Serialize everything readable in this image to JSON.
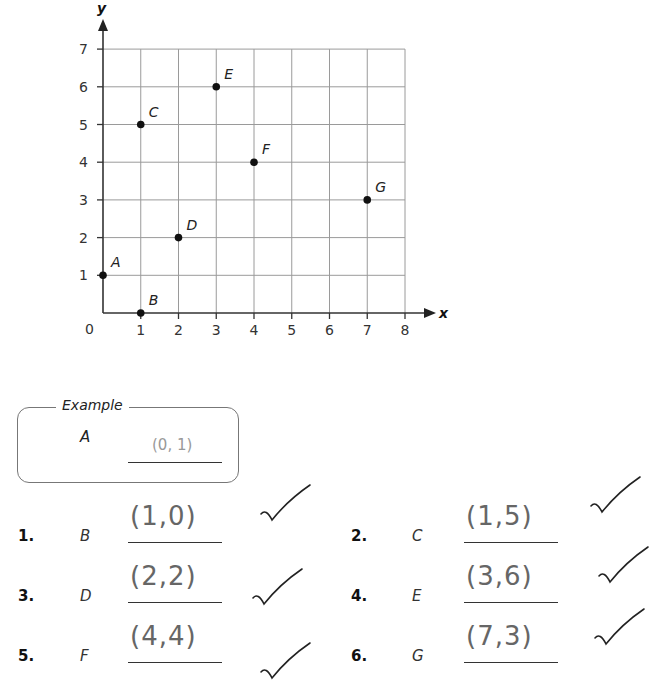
{
  "chart_data": {
    "type": "scatter",
    "title": "",
    "xlabel": "x",
    "ylabel": "y",
    "xlim": [
      0,
      8
    ],
    "ylim": [
      0,
      7
    ],
    "grid": true,
    "origin_label": "0",
    "x_ticks": [
      "1",
      "2",
      "3",
      "4",
      "5",
      "6",
      "7",
      "8"
    ],
    "y_ticks": [
      "1",
      "2",
      "3",
      "4",
      "5",
      "6",
      "7"
    ],
    "points": [
      {
        "label": "A",
        "x": 0,
        "y": 1
      },
      {
        "label": "B",
        "x": 1,
        "y": 0
      },
      {
        "label": "C",
        "x": 1,
        "y": 5
      },
      {
        "label": "D",
        "x": 2,
        "y": 2
      },
      {
        "label": "E",
        "x": 3,
        "y": 6
      },
      {
        "label": "F",
        "x": 4,
        "y": 4
      },
      {
        "label": "G",
        "x": 7,
        "y": 3
      }
    ]
  },
  "example": {
    "title": "Example",
    "point": "A",
    "answer": "(0, 1)"
  },
  "questions": [
    {
      "number": "1.",
      "point": "B",
      "answer": "(1,0)",
      "checked": true
    },
    {
      "number": "2.",
      "point": "C",
      "answer": "(1,5)",
      "checked": true
    },
    {
      "number": "3.",
      "point": "D",
      "answer": "(2,2)",
      "checked": true
    },
    {
      "number": "4.",
      "point": "E",
      "answer": "(3,6)",
      "checked": true
    },
    {
      "number": "5.",
      "point": "F",
      "answer": "(4,4)",
      "checked": true
    },
    {
      "number": "6.",
      "point": "G",
      "answer": "(7,3)",
      "checked": true
    }
  ]
}
